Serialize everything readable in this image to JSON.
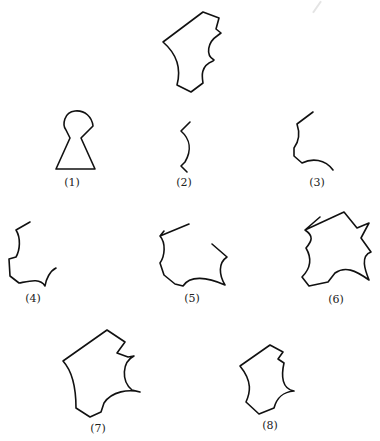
{
  "figure": {
    "target_shape": {
      "name": "target",
      "label": ""
    },
    "items": [
      {
        "id": 1,
        "label": "(1)",
        "description": "keyhole shape"
      },
      {
        "id": 2,
        "label": "(2)",
        "description": "S-curve fragment"
      },
      {
        "id": 3,
        "label": "(3)",
        "description": "curved edge fragment"
      },
      {
        "id": 4,
        "label": "(4)",
        "description": "partial outline with concave notch"
      },
      {
        "id": 5,
        "label": "(5)",
        "description": "partial outline open at top"
      },
      {
        "id": 6,
        "label": "(6)",
        "description": "nearly closed outline"
      },
      {
        "id": 7,
        "label": "(7)",
        "description": "closed outline matching target"
      },
      {
        "id": 8,
        "label": "(8)",
        "description": "closed outline variant"
      }
    ]
  },
  "colors": {
    "stroke": "#111111",
    "background": "#ffffff",
    "label": "#222222"
  }
}
